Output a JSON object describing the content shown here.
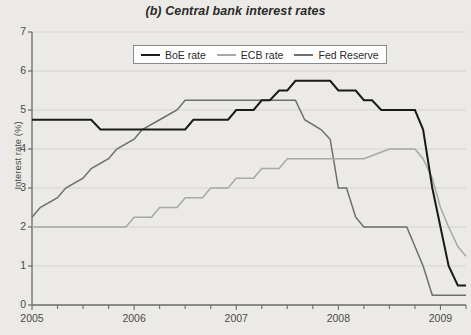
{
  "chart_data": {
    "type": "line",
    "title": "(b) Central bank interest rates",
    "xlabel": "",
    "ylabel": "Interest rate (%)",
    "xlim": [
      2005.0,
      2009.25
    ],
    "ylim": [
      0,
      7
    ],
    "yticks": [
      0,
      1,
      2,
      3,
      4,
      5,
      6,
      7
    ],
    "ytick_labels": [
      "0",
      "1",
      "2",
      "3",
      "4",
      "5",
      "6",
      "7"
    ],
    "xticks": [
      2005,
      2006,
      2007,
      2008,
      2009
    ],
    "xtick_labels": [
      "2005",
      "2006",
      "2007",
      "2008",
      "2009"
    ],
    "x_minor_tick_interval": 0.25,
    "grid": "horizontal",
    "legend_position": "top-center-inside",
    "series": [
      {
        "name": "BoE rate",
        "color": "#1a1a1a",
        "points": [
          [
            2005.0,
            4.75
          ],
          [
            2005.58,
            4.75
          ],
          [
            2005.67,
            4.5
          ],
          [
            2006.5,
            4.5
          ],
          [
            2006.58,
            4.75
          ],
          [
            2006.92,
            4.75
          ],
          [
            2007.0,
            5.0
          ],
          [
            2007.17,
            5.0
          ],
          [
            2007.25,
            5.25
          ],
          [
            2007.33,
            5.25
          ],
          [
            2007.42,
            5.5
          ],
          [
            2007.5,
            5.5
          ],
          [
            2007.58,
            5.75
          ],
          [
            2007.92,
            5.75
          ],
          [
            2008.0,
            5.5
          ],
          [
            2008.17,
            5.5
          ],
          [
            2008.25,
            5.25
          ],
          [
            2008.33,
            5.25
          ],
          [
            2008.42,
            5.0
          ],
          [
            2008.75,
            5.0
          ],
          [
            2008.83,
            4.5
          ],
          [
            2008.92,
            3.0
          ],
          [
            2009.0,
            2.0
          ],
          [
            2009.08,
            1.0
          ],
          [
            2009.17,
            0.5
          ],
          [
            2009.25,
            0.5
          ]
        ]
      },
      {
        "name": "ECB rate",
        "color": "#a8a8a8",
        "points": [
          [
            2005.0,
            2.0
          ],
          [
            2005.92,
            2.0
          ],
          [
            2006.0,
            2.25
          ],
          [
            2006.17,
            2.25
          ],
          [
            2006.25,
            2.5
          ],
          [
            2006.42,
            2.5
          ],
          [
            2006.5,
            2.75
          ],
          [
            2006.67,
            2.75
          ],
          [
            2006.75,
            3.0
          ],
          [
            2006.92,
            3.0
          ],
          [
            2007.0,
            3.25
          ],
          [
            2007.17,
            3.25
          ],
          [
            2007.25,
            3.5
          ],
          [
            2007.42,
            3.5
          ],
          [
            2007.5,
            3.75
          ],
          [
            2008.25,
            3.75
          ],
          [
            2008.5,
            4.0
          ],
          [
            2008.75,
            4.0
          ],
          [
            2008.83,
            3.75
          ],
          [
            2008.92,
            3.25
          ],
          [
            2009.0,
            2.5
          ],
          [
            2009.08,
            2.0
          ],
          [
            2009.17,
            1.5
          ],
          [
            2009.25,
            1.25
          ]
        ]
      },
      {
        "name": "Fed Reserve",
        "color": "#6e6e6e",
        "points": [
          [
            2005.0,
            2.25
          ],
          [
            2005.08,
            2.5
          ],
          [
            2005.25,
            2.75
          ],
          [
            2005.33,
            3.0
          ],
          [
            2005.5,
            3.25
          ],
          [
            2005.58,
            3.5
          ],
          [
            2005.75,
            3.75
          ],
          [
            2005.83,
            4.0
          ],
          [
            2006.0,
            4.25
          ],
          [
            2006.08,
            4.5
          ],
          [
            2006.25,
            4.75
          ],
          [
            2006.42,
            5.0
          ],
          [
            2006.5,
            5.25
          ],
          [
            2007.58,
            5.25
          ],
          [
            2007.67,
            4.75
          ],
          [
            2007.83,
            4.5
          ],
          [
            2007.92,
            4.25
          ],
          [
            2008.0,
            3.0
          ],
          [
            2008.08,
            3.0
          ],
          [
            2008.17,
            2.25
          ],
          [
            2008.25,
            2.0
          ],
          [
            2008.67,
            2.0
          ],
          [
            2008.75,
            1.5
          ],
          [
            2008.83,
            1.0
          ],
          [
            2008.92,
            0.25
          ],
          [
            2009.25,
            0.25
          ]
        ]
      }
    ]
  },
  "legend": {
    "items": [
      {
        "label": "BoE rate",
        "color": "#1a1a1a"
      },
      {
        "label": "ECB rate",
        "color": "#a8a8a8"
      },
      {
        "label": "Fed Reserve",
        "color": "#6e6e6e"
      }
    ]
  }
}
